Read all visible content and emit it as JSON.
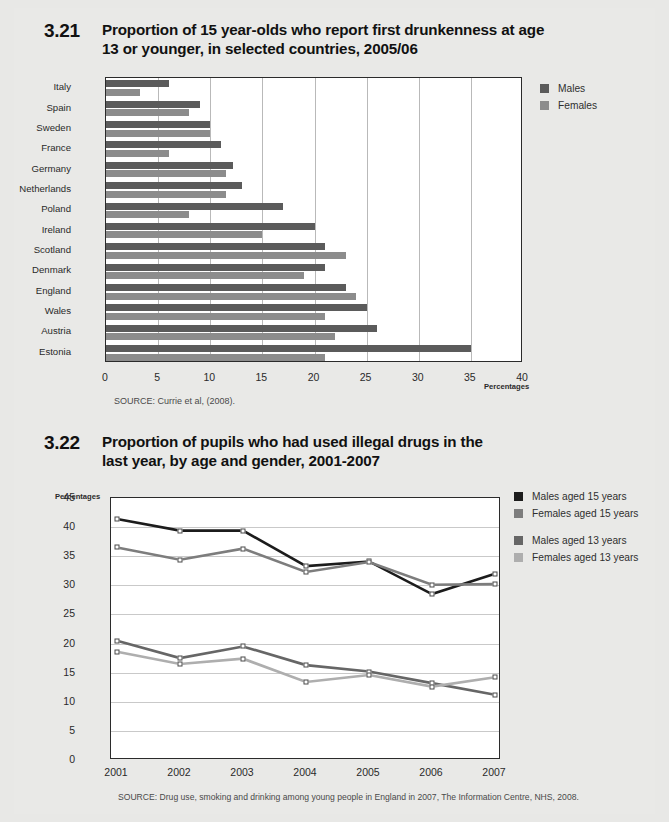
{
  "figures": [
    {
      "number": "3.21",
      "title_line1": "Proportion of 15 year-olds who report first drunkenness at age",
      "title_line2": "13 or younger, in selected countries, 2005/06",
      "source": "SOURCE:  Currie et al, (2008).",
      "axis_note": "Percentages",
      "legend": [
        {
          "label": "Males",
          "color": "#5b5b5b"
        },
        {
          "label": "Females",
          "color": "#8c8c8c"
        }
      ]
    },
    {
      "number": "3.22",
      "title_line1": "Proportion of pupils who had used illegal drugs in the",
      "title_line2": "last year, by age and gender, 2001-2007",
      "source": "SOURCE: Drug use, smoking and drinking among young people in England in 2007, The Information Centre, NHS, 2008.",
      "axis_note": "Percentages",
      "legend": [
        {
          "label": "Males aged 15 years",
          "color": "#1c1c1c"
        },
        {
          "label": "Females aged 15 years",
          "color": "#7d7d7d"
        },
        {
          "label": "Males aged 13 years",
          "color": "#666666"
        },
        {
          "label": "Females aged 13 years",
          "color": "#aeaeae"
        }
      ]
    }
  ],
  "chart_data": [
    {
      "type": "bar",
      "orientation": "horizontal",
      "title": "Proportion of 15 year-olds who report first drunkenness at age 13 or younger, in selected countries, 2005/06",
      "xlabel": "Percentages",
      "ylabel": "",
      "xlim": [
        0,
        40
      ],
      "xticks": [
        0,
        5,
        10,
        15,
        20,
        25,
        30,
        35,
        40
      ],
      "grid": "vertical",
      "legend_position": "right",
      "categories": [
        "Italy",
        "Spain",
        "Sweden",
        "France",
        "Germany",
        "Netherlands",
        "Poland",
        "Ireland",
        "Scotland",
        "Denmark",
        "England",
        "Wales",
        "Austria",
        "Estonia"
      ],
      "series": [
        {
          "name": "Males",
          "color": "#5b5b5b",
          "values": [
            6.0,
            9.0,
            10.0,
            11.0,
            12.2,
            13.0,
            17.0,
            20.0,
            21.0,
            21.0,
            23.0,
            25.0,
            26.0,
            35.0
          ]
        },
        {
          "name": "Females",
          "color": "#8c8c8c",
          "values": [
            3.3,
            8.0,
            10.0,
            6.0,
            11.5,
            11.5,
            8.0,
            15.0,
            23.0,
            19.0,
            24.0,
            21.0,
            22.0,
            21.0
          ]
        }
      ]
    },
    {
      "type": "line",
      "title": "Proportion of pupils who had used illegal drugs in the last year, by age and gender, 2001-2007",
      "xlabel": "",
      "ylabel": "Percentages",
      "ylim": [
        0,
        45
      ],
      "yticks": [
        0,
        5,
        10,
        15,
        20,
        25,
        30,
        35,
        40,
        45
      ],
      "grid": "horizontal",
      "legend_position": "right",
      "x": [
        "2001",
        "2002",
        "2003",
        "2004",
        "2005",
        "2006",
        "2007"
      ],
      "series": [
        {
          "name": "Males aged 15 years",
          "color": "#1c1c1c",
          "values": [
            41.4,
            39.4,
            39.4,
            33.3,
            34.1,
            28.5,
            32.0
          ]
        },
        {
          "name": "Females aged 15 years",
          "color": "#7d7d7d",
          "values": [
            36.5,
            34.4,
            36.3,
            32.3,
            34.0,
            30.1,
            30.2
          ]
        },
        {
          "name": "Males aged 13 years",
          "color": "#666666",
          "values": [
            20.5,
            17.5,
            19.5,
            16.3,
            15.2,
            13.2,
            11.2
          ]
        },
        {
          "name": "Females aged 13 years",
          "color": "#aeaeae",
          "values": [
            18.6,
            16.5,
            17.4,
            13.4,
            14.6,
            12.6,
            14.2
          ]
        }
      ]
    }
  ]
}
